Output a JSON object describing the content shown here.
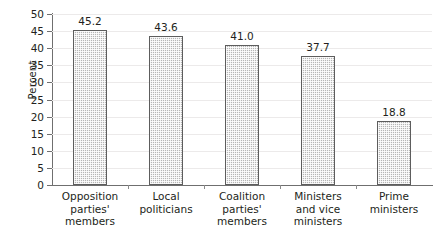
{
  "chart_data": {
    "type": "bar",
    "title": "",
    "subtitle": "",
    "xlabel": "",
    "ylabel": "Percent",
    "ylim": [
      0,
      50
    ],
    "ytick_step": 5,
    "yticks": [
      "50",
      "45",
      "40",
      "35",
      "30",
      "25",
      "20",
      "15",
      "10",
      "5",
      "0"
    ],
    "grid": true,
    "legend": null,
    "categories": [
      "Opposition parties' members",
      "Local politicians",
      "Coalition parties' members",
      "Ministers and vice ministers",
      "Prime ministers"
    ],
    "category_lines": [
      [
        "Opposition",
        "parties'",
        "members"
      ],
      [
        "Local",
        "politicians"
      ],
      [
        "Coalition",
        "parties'",
        "members"
      ],
      [
        "Ministers",
        "and vice",
        "ministers"
      ],
      [
        "Prime",
        "ministers"
      ]
    ],
    "values": [
      45.2,
      43.6,
      41.0,
      37.7,
      18.8
    ],
    "value_labels": [
      "45.2",
      "43.6",
      "41.0",
      "37.7",
      "18.8"
    ],
    "bar_fill_color": "#b6b6b6",
    "bar_border_color": "#5d5d5d",
    "axis_color": "#6f6f6f",
    "grid_color": "#eceaea",
    "text_color": "#231f20"
  }
}
